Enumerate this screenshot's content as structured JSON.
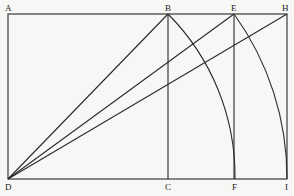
{
  "diagram": {
    "points": {
      "A": {
        "label": "A",
        "x": 8,
        "y": 14
      },
      "B": {
        "label": "B",
        "x": 168,
        "y": 14
      },
      "E": {
        "label": "E",
        "x": 234,
        "y": 14
      },
      "H": {
        "label": "H",
        "x": 287,
        "y": 14
      },
      "D": {
        "label": "D",
        "x": 8,
        "y": 179
      },
      "C": {
        "label": "C",
        "x": 168,
        "y": 179
      },
      "F": {
        "label": "F",
        "x": 235,
        "y": 179
      },
      "I": {
        "label": "I",
        "x": 287,
        "y": 179
      }
    },
    "segments": [
      "AH",
      "DI",
      "AD",
      "HI",
      "BC",
      "EF",
      "DB",
      "DE",
      "DH"
    ],
    "arcs": [
      {
        "from": "B",
        "to": "F",
        "center": "D"
      },
      {
        "from": "E",
        "to": "I",
        "center": "D"
      }
    ],
    "colors": {
      "background": "#f7f7f5",
      "stroke": "#2a2a2a"
    }
  }
}
